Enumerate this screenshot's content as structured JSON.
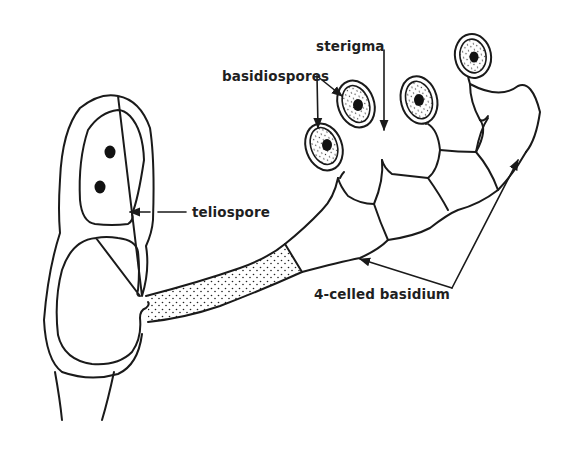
{
  "diagram": {
    "labels": {
      "sterigma": "sterigma",
      "basidiospores": "basidiospores",
      "teliospore": "teliospore",
      "basidium": "4-celled basidium"
    },
    "colors": {
      "ink": "#1a1a1a",
      "background": "#ffffff"
    }
  }
}
